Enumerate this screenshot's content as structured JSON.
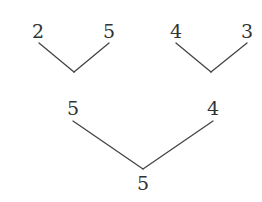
{
  "diagram": {
    "type": "tree",
    "line_color": "#444444",
    "text_color": "#333333",
    "level0": [
      {
        "id": "a",
        "label": "2",
        "x": 38,
        "y": 31
      },
      {
        "id": "b",
        "label": "5",
        "x": 109,
        "y": 31
      },
      {
        "id": "c",
        "label": "4",
        "x": 176,
        "y": 31
      },
      {
        "id": "d",
        "label": "3",
        "x": 247,
        "y": 31
      }
    ],
    "level1": [
      {
        "id": "e",
        "label": "5",
        "x": 73,
        "y": 108
      },
      {
        "id": "f",
        "label": "4",
        "x": 213,
        "y": 108
      }
    ],
    "level2": [
      {
        "id": "g",
        "label": "5",
        "x": 143,
        "y": 183
      }
    ],
    "edges": [
      {
        "from": "a",
        "to": "left-join",
        "x1": 39,
        "y1": 43,
        "x2": 74,
        "y2": 72
      },
      {
        "from": "b",
        "to": "left-join",
        "x1": 109,
        "y1": 43,
        "x2": 74,
        "y2": 72
      },
      {
        "from": "c",
        "to": "right-join",
        "x1": 176,
        "y1": 43,
        "x2": 211,
        "y2": 72
      },
      {
        "from": "d",
        "to": "right-join",
        "x1": 247,
        "y1": 43,
        "x2": 211,
        "y2": 72
      },
      {
        "from": "e",
        "to": "g",
        "x1": 73,
        "y1": 121,
        "x2": 143,
        "y2": 169
      },
      {
        "from": "f",
        "to": "g",
        "x1": 213,
        "y1": 121,
        "x2": 143,
        "y2": 169
      }
    ]
  }
}
